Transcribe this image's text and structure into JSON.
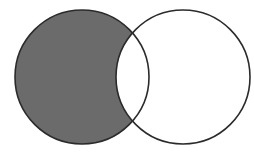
{
  "diagram": {
    "type": "venn",
    "sets": [
      {
        "name": "A",
        "position": "left",
        "shaded_region": "A only"
      },
      {
        "name": "B",
        "position": "right",
        "shaded_region": "none"
      }
    ],
    "shaded_region": "A - B",
    "colors": {
      "shade": "#6b6b6b",
      "outline": "#2b2b2b",
      "background": "#ffffff"
    }
  }
}
